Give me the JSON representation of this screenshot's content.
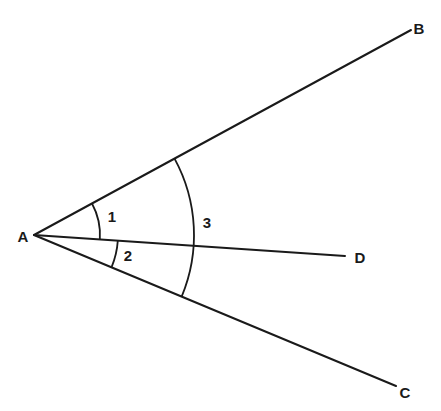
{
  "diagram": {
    "type": "angle-diagram",
    "vertex": {
      "label": "A",
      "x": 34,
      "y": 235,
      "label_x": 23,
      "label_y": 242
    },
    "rays": [
      {
        "name": "AB",
        "end_label": "B",
        "x2": 411,
        "y2": 30,
        "label_x": 419,
        "label_y": 34
      },
      {
        "name": "AD",
        "end_label": "D",
        "x2": 345,
        "y2": 256,
        "label_x": 360,
        "label_y": 263
      },
      {
        "name": "AC",
        "end_label": "C",
        "x2": 396,
        "y2": 386,
        "label_x": 405,
        "label_y": 398
      }
    ],
    "arcs": [
      {
        "name": "angle-1",
        "label": "1",
        "from": "AB",
        "to": "AD",
        "radius": 66,
        "label_x": 112,
        "label_y": 222
      },
      {
        "name": "angle-2",
        "label": "2",
        "from": "AD",
        "to": "AC",
        "radius": 84,
        "label_x": 128,
        "label_y": 261
      },
      {
        "name": "angle-3",
        "label": "3",
        "from": "AB",
        "to": "AC",
        "radius": 160,
        "label_x": 207,
        "label_y": 228
      }
    ],
    "stroke_color": "#1a1a1a",
    "background": "#ffffff"
  }
}
